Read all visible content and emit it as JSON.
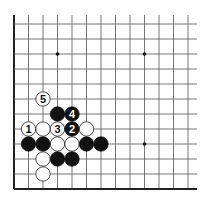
{
  "diagram": {
    "grid": {
      "origin_x": 14,
      "origin_y": 24,
      "spacing_x": 14.5,
      "spacing_y": 15,
      "columns": 13,
      "rows": 12,
      "line_top": 15,
      "line_right": 197,
      "line_color": "#555555",
      "edge_color": "#222222",
      "left_edge": true,
      "bottom_edge": true
    },
    "star_points": [
      {
        "col": 3,
        "row": 2
      },
      {
        "col": 9,
        "row": 2
      },
      {
        "col": 9,
        "row": 8
      }
    ],
    "stones": [
      {
        "col": 2,
        "row": 5,
        "color": "white",
        "label": "5"
      },
      {
        "col": 3,
        "row": 6,
        "color": "black",
        "label": ""
      },
      {
        "col": 4,
        "row": 6,
        "color": "black",
        "label": "4"
      },
      {
        "col": 1,
        "row": 7,
        "color": "white",
        "label": "1"
      },
      {
        "col": 2,
        "row": 7,
        "color": "white",
        "label": ""
      },
      {
        "col": 3,
        "row": 7,
        "color": "white",
        "label": "3"
      },
      {
        "col": 4,
        "row": 7,
        "color": "black",
        "label": "2"
      },
      {
        "col": 5,
        "row": 7,
        "color": "white",
        "label": ""
      },
      {
        "col": 1,
        "row": 8,
        "color": "black",
        "label": ""
      },
      {
        "col": 2,
        "row": 8,
        "color": "black",
        "label": ""
      },
      {
        "col": 3,
        "row": 8,
        "color": "white",
        "label": ""
      },
      {
        "col": 4,
        "row": 8,
        "color": "white",
        "label": ""
      },
      {
        "col": 5,
        "row": 8,
        "color": "black",
        "label": ""
      },
      {
        "col": 6,
        "row": 8,
        "color": "black",
        "label": ""
      },
      {
        "col": 2,
        "row": 9,
        "color": "white",
        "label": ""
      },
      {
        "col": 3,
        "row": 9,
        "color": "black",
        "label": ""
      },
      {
        "col": 4,
        "row": 9,
        "color": "black",
        "label": ""
      },
      {
        "col": 2,
        "row": 10,
        "color": "white",
        "label": ""
      }
    ],
    "colors": {
      "black_stone": "#111111",
      "white_stone": "#ffffff",
      "white_stone_outline": "#222222",
      "black_label": "#ffffff",
      "white_label": "#111111"
    }
  }
}
